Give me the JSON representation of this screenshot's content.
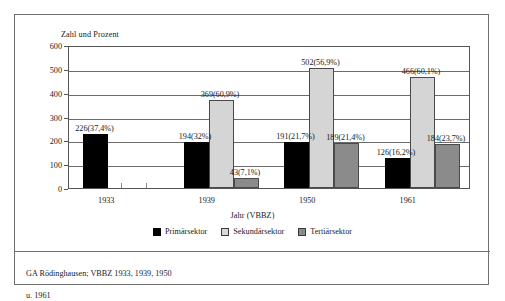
{
  "figure": {
    "caption_line1": "GA Rödinghausen; VBBZ 1933, 1939, 1950",
    "caption_line2": "u. 1961"
  },
  "chart_data": {
    "type": "bar",
    "title": "",
    "ylabel": "Zahl und Prozent",
    "xlabel": "Jahr (VBBZ)",
    "categories": [
      "1933",
      "1939",
      "1950",
      "1961"
    ],
    "ylim": [
      0,
      600
    ],
    "yticks": [
      0,
      100,
      200,
      300,
      400,
      500,
      600
    ],
    "grid": true,
    "legend_position": "bottom",
    "series": [
      {
        "name": "Primärsektor",
        "color": "#000000",
        "values": [
          226,
          194,
          191,
          126
        ],
        "labels": [
          "226(37,4%)",
          "194(32%)",
          "191(21,7%)",
          "126(16,2%)"
        ],
        "percents": [
          37.4,
          32.0,
          21.7,
          16.2
        ]
      },
      {
        "name": "Sekundärsektor",
        "color": "#d5d5d5",
        "values": [
          null,
          369,
          502,
          466
        ],
        "labels": [
          "",
          "369(60,9%)",
          "502(56,9%)",
          "466(60,1%)"
        ],
        "percents": [
          null,
          60.9,
          56.9,
          60.1
        ]
      },
      {
        "name": "Tertiärsektor",
        "color": "#8b8b8b",
        "values": [
          null,
          43,
          189,
          184
        ],
        "labels": [
          "",
          "43(7,1%)",
          "189(21,4%)",
          "184(23,7%)"
        ],
        "percents": [
          null,
          7.1,
          21.4,
          23.7
        ]
      }
    ]
  }
}
